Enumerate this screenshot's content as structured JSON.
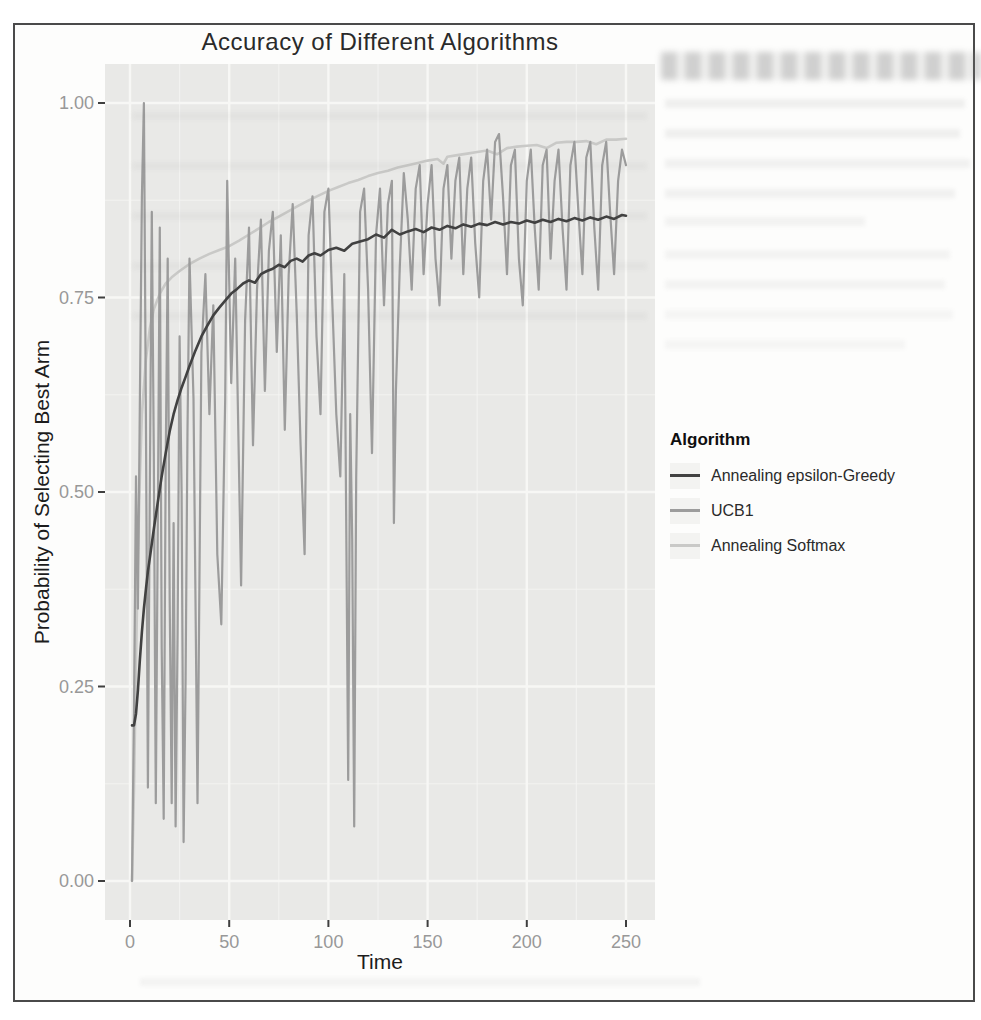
{
  "chart": {
    "title": "Accuracy of Different Algorithms",
    "x_label": "Time",
    "y_label": "Probability of Selecting Best Arm",
    "x_tick_labels": [
      "0",
      "50",
      "100",
      "150",
      "200",
      "250"
    ],
    "y_tick_labels": [
      "1.00",
      "0.75",
      "0.50",
      "0.25",
      "0.00"
    ]
  },
  "colors": {
    "frame_border": "#4a4a4a",
    "panel_bg": "#e9e9e7",
    "grid_major": "#f7f7f5",
    "grid_minor": "#f5f5f3",
    "tick_mark": "#3f3f3f",
    "axis_text": "#989898",
    "title_text": "#2a2a2a",
    "series_epsilon_greedy": "#414141",
    "series_ucb1": "#9c9c9c",
    "series_softmax": "#c9c9c7",
    "legend_key_bg": "#f3f3f1"
  },
  "chart_data": {
    "type": "line",
    "title": "Accuracy of Different Algorithms",
    "xlabel": "Time",
    "ylabel": "Probability of Selecting Best Arm",
    "xlim": [
      0,
      250
    ],
    "ylim": [
      0.0,
      1.0
    ],
    "x_ticks": [
      0,
      50,
      100,
      150,
      200,
      250
    ],
    "y_ticks": [
      1.0,
      0.75,
      0.5,
      0.25,
      0.0
    ],
    "grid": true,
    "legend_position": "right",
    "legend_title": "Algorithm",
    "series": [
      {
        "name": "Annealing epsilon-Greedy",
        "color": "#414141",
        "width": 2.6,
        "points": [
          [
            1,
            0.2
          ],
          [
            2,
            0.2
          ],
          [
            3,
            0.215
          ],
          [
            4,
            0.245
          ],
          [
            5,
            0.285
          ],
          [
            6,
            0.32
          ],
          [
            7,
            0.35
          ],
          [
            8,
            0.375
          ],
          [
            9,
            0.398
          ],
          [
            10,
            0.415
          ],
          [
            12,
            0.452
          ],
          [
            14,
            0.487
          ],
          [
            16,
            0.52
          ],
          [
            18,
            0.55
          ],
          [
            20,
            0.578
          ],
          [
            22,
            0.6
          ],
          [
            24,
            0.618
          ],
          [
            26,
            0.634
          ],
          [
            28,
            0.648
          ],
          [
            30,
            0.662
          ],
          [
            33,
            0.682
          ],
          [
            36,
            0.7
          ],
          [
            39,
            0.714
          ],
          [
            42,
            0.727
          ],
          [
            45,
            0.737
          ],
          [
            48,
            0.746
          ],
          [
            51,
            0.755
          ],
          [
            54,
            0.761
          ],
          [
            57,
            0.768
          ],
          [
            60,
            0.772
          ],
          [
            63,
            0.769
          ],
          [
            66,
            0.78
          ],
          [
            69,
            0.784
          ],
          [
            72,
            0.787
          ],
          [
            75,
            0.792
          ],
          [
            78,
            0.789
          ],
          [
            81,
            0.797
          ],
          [
            84,
            0.8
          ],
          [
            87,
            0.796
          ],
          [
            90,
            0.804
          ],
          [
            93,
            0.807
          ],
          [
            96,
            0.804
          ],
          [
            100,
            0.811
          ],
          [
            104,
            0.814
          ],
          [
            108,
            0.81
          ],
          [
            112,
            0.819
          ],
          [
            116,
            0.822
          ],
          [
            120,
            0.825
          ],
          [
            124,
            0.831
          ],
          [
            128,
            0.827
          ],
          [
            132,
            0.837
          ],
          [
            136,
            0.831
          ],
          [
            140,
            0.835
          ],
          [
            144,
            0.838
          ],
          [
            148,
            0.834
          ],
          [
            152,
            0.84
          ],
          [
            156,
            0.837
          ],
          [
            160,
            0.842
          ],
          [
            164,
            0.839
          ],
          [
            168,
            0.844
          ],
          [
            172,
            0.841
          ],
          [
            176,
            0.845
          ],
          [
            180,
            0.843
          ],
          [
            184,
            0.847
          ],
          [
            188,
            0.844
          ],
          [
            192,
            0.847
          ],
          [
            196,
            0.845
          ],
          [
            200,
            0.849
          ],
          [
            204,
            0.846
          ],
          [
            208,
            0.85
          ],
          [
            212,
            0.847
          ],
          [
            216,
            0.851
          ],
          [
            220,
            0.848
          ],
          [
            224,
            0.852
          ],
          [
            228,
            0.849
          ],
          [
            232,
            0.853
          ],
          [
            236,
            0.85
          ],
          [
            240,
            0.854
          ],
          [
            244,
            0.851
          ],
          [
            248,
            0.856
          ],
          [
            250,
            0.855
          ]
        ]
      },
      {
        "name": "UCB1",
        "color": "#9c9c9c",
        "width": 2.2,
        "points": [
          [
            1,
            0.0
          ],
          [
            2,
            0.22
          ],
          [
            3,
            0.52
          ],
          [
            4,
            0.35
          ],
          [
            5,
            0.62
          ],
          [
            6,
            0.88
          ],
          [
            7,
            1.0
          ],
          [
            8,
            0.6
          ],
          [
            9,
            0.12
          ],
          [
            10,
            0.5
          ],
          [
            11,
            0.86
          ],
          [
            12,
            0.55
          ],
          [
            13,
            0.1
          ],
          [
            14,
            0.46
          ],
          [
            15,
            0.84
          ],
          [
            16,
            0.3
          ],
          [
            17,
            0.08
          ],
          [
            18,
            0.54
          ],
          [
            19,
            0.8
          ],
          [
            20,
            0.36
          ],
          [
            21,
            0.1
          ],
          [
            22,
            0.46
          ],
          [
            23,
            0.07
          ],
          [
            24,
            0.32
          ],
          [
            25,
            0.7
          ],
          [
            26,
            0.5
          ],
          [
            27,
            0.05
          ],
          [
            28,
            0.26
          ],
          [
            29,
            0.58
          ],
          [
            30,
            0.8
          ],
          [
            32,
            0.62
          ],
          [
            34,
            0.1
          ],
          [
            35,
            0.38
          ],
          [
            36,
            0.68
          ],
          [
            38,
            0.78
          ],
          [
            40,
            0.6
          ],
          [
            42,
            0.74
          ],
          [
            44,
            0.42
          ],
          [
            46,
            0.33
          ],
          [
            48,
            0.62
          ],
          [
            49,
            0.9
          ],
          [
            51,
            0.64
          ],
          [
            53,
            0.8
          ],
          [
            56,
            0.38
          ],
          [
            58,
            0.72
          ],
          [
            60,
            0.84
          ],
          [
            62,
            0.56
          ],
          [
            64,
            0.76
          ],
          [
            66,
            0.85
          ],
          [
            68,
            0.63
          ],
          [
            70,
            0.81
          ],
          [
            72,
            0.86
          ],
          [
            74,
            0.68
          ],
          [
            76,
            0.83
          ],
          [
            78,
            0.58
          ],
          [
            80,
            0.78
          ],
          [
            82,
            0.87
          ],
          [
            84,
            0.73
          ],
          [
            86,
            0.56
          ],
          [
            88,
            0.42
          ],
          [
            90,
            0.83
          ],
          [
            92,
            0.88
          ],
          [
            94,
            0.7
          ],
          [
            96,
            0.6
          ],
          [
            98,
            0.86
          ],
          [
            100,
            0.89
          ],
          [
            102,
            0.74
          ],
          [
            104,
            0.6
          ],
          [
            106,
            0.52
          ],
          [
            108,
            0.78
          ],
          [
            110,
            0.13
          ],
          [
            111,
            0.6
          ],
          [
            112,
            0.44
          ],
          [
            113,
            0.07
          ],
          [
            114,
            0.52
          ],
          [
            116,
            0.86
          ],
          [
            118,
            0.89
          ],
          [
            120,
            0.76
          ],
          [
            122,
            0.55
          ],
          [
            124,
            0.83
          ],
          [
            126,
            0.89
          ],
          [
            128,
            0.74
          ],
          [
            130,
            0.87
          ],
          [
            132,
            0.9
          ],
          [
            133,
            0.46
          ],
          [
            134,
            0.63
          ],
          [
            136,
            0.79
          ],
          [
            138,
            0.91
          ],
          [
            140,
            0.85
          ],
          [
            142,
            0.76
          ],
          [
            144,
            0.89
          ],
          [
            146,
            0.92
          ],
          [
            148,
            0.78
          ],
          [
            150,
            0.87
          ],
          [
            152,
            0.92
          ],
          [
            154,
            0.8
          ],
          [
            156,
            0.74
          ],
          [
            158,
            0.89
          ],
          [
            160,
            0.92
          ],
          [
            162,
            0.8
          ],
          [
            164,
            0.9
          ],
          [
            166,
            0.93
          ],
          [
            168,
            0.78
          ],
          [
            170,
            0.89
          ],
          [
            172,
            0.93
          ],
          [
            174,
            0.82
          ],
          [
            176,
            0.75
          ],
          [
            178,
            0.9
          ],
          [
            180,
            0.94
          ],
          [
            182,
            0.85
          ],
          [
            184,
            0.95
          ],
          [
            186,
            0.96
          ],
          [
            188,
            0.88
          ],
          [
            190,
            0.78
          ],
          [
            192,
            0.92
          ],
          [
            194,
            0.94
          ],
          [
            196,
            0.8
          ],
          [
            198,
            0.74
          ],
          [
            200,
            0.9
          ],
          [
            202,
            0.94
          ],
          [
            204,
            0.84
          ],
          [
            206,
            0.76
          ],
          [
            208,
            0.92
          ],
          [
            210,
            0.94
          ],
          [
            212,
            0.8
          ],
          [
            214,
            0.9
          ],
          [
            216,
            0.94
          ],
          [
            218,
            0.84
          ],
          [
            220,
            0.76
          ],
          [
            222,
            0.92
          ],
          [
            224,
            0.95
          ],
          [
            226,
            0.86
          ],
          [
            228,
            0.78
          ],
          [
            230,
            0.93
          ],
          [
            232,
            0.95
          ],
          [
            234,
            0.84
          ],
          [
            236,
            0.76
          ],
          [
            238,
            0.92
          ],
          [
            240,
            0.95
          ],
          [
            242,
            0.86
          ],
          [
            244,
            0.78
          ],
          [
            246,
            0.9
          ],
          [
            248,
            0.94
          ],
          [
            250,
            0.92
          ]
        ]
      },
      {
        "name": "Annealing Softmax",
        "color": "#c9c9c7",
        "width": 2.6,
        "points": [
          [
            1,
            0.0
          ],
          [
            2,
            0.12
          ],
          [
            3,
            0.28
          ],
          [
            4,
            0.42
          ],
          [
            5,
            0.52
          ],
          [
            6,
            0.6
          ],
          [
            8,
            0.67
          ],
          [
            10,
            0.71
          ],
          [
            12,
            0.735
          ],
          [
            15,
            0.755
          ],
          [
            18,
            0.768
          ],
          [
            21,
            0.776
          ],
          [
            25,
            0.784
          ],
          [
            30,
            0.793
          ],
          [
            35,
            0.8
          ],
          [
            40,
            0.806
          ],
          [
            45,
            0.811
          ],
          [
            50,
            0.816
          ],
          [
            55,
            0.823
          ],
          [
            60,
            0.831
          ],
          [
            65,
            0.839
          ],
          [
            70,
            0.847
          ],
          [
            75,
            0.854
          ],
          [
            80,
            0.861
          ],
          [
            85,
            0.868
          ],
          [
            90,
            0.875
          ],
          [
            95,
            0.881
          ],
          [
            100,
            0.887
          ],
          [
            105,
            0.892
          ],
          [
            110,
            0.897
          ],
          [
            115,
            0.901
          ],
          [
            120,
            0.906
          ],
          [
            125,
            0.91
          ],
          [
            130,
            0.913
          ],
          [
            135,
            0.917
          ],
          [
            140,
            0.92
          ],
          [
            145,
            0.923
          ],
          [
            150,
            0.926
          ],
          [
            155,
            0.928
          ],
          [
            158,
            0.922
          ],
          [
            160,
            0.931
          ],
          [
            165,
            0.933
          ],
          [
            170,
            0.935
          ],
          [
            175,
            0.937
          ],
          [
            180,
            0.939
          ],
          [
            185,
            0.934
          ],
          [
            190,
            0.942
          ],
          [
            195,
            0.944
          ],
          [
            200,
            0.945
          ],
          [
            205,
            0.946
          ],
          [
            210,
            0.942
          ],
          [
            215,
            0.949
          ],
          [
            220,
            0.95
          ],
          [
            225,
            0.95
          ],
          [
            230,
            0.951
          ],
          [
            235,
            0.947
          ],
          [
            240,
            0.953
          ],
          [
            245,
            0.953
          ],
          [
            250,
            0.954
          ]
        ]
      }
    ]
  }
}
